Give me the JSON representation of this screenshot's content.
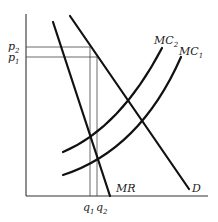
{
  "diagram": {
    "type": "monopoly-cost-shift",
    "axes": {
      "origin": [
        26,
        196
      ],
      "y_top": 20,
      "x_right": 210
    },
    "curves": [
      {
        "name": "MR",
        "label": "MR",
        "path": "M53,22 L110,196"
      },
      {
        "name": "D",
        "label": "D",
        "path": "M70,16 L189,189"
      },
      {
        "name": "MC2",
        "label": "MC",
        "sub": "2",
        "path": "M63,152 Q120,125 162,48"
      },
      {
        "name": "MC1",
        "label": "MC",
        "sub": "1",
        "path": "M63,175 Q140,148 181,57"
      }
    ],
    "price_labels": [
      {
        "label": "p",
        "sub": "2",
        "y": 47
      },
      {
        "label": "p",
        "sub": "1",
        "y": 57
      }
    ],
    "quantity_labels": [
      {
        "label": "q",
        "sub": "1",
        "x": 90
      },
      {
        "label": "q",
        "sub": "2",
        "x": 97
      }
    ],
    "curve_labels": {
      "mc2": {
        "text": "MC",
        "sub": "2"
      },
      "mc1": {
        "text": "MC",
        "sub": "1"
      },
      "mr": {
        "text": "MR"
      },
      "d": {
        "text": "D"
      }
    },
    "axis_labels": {
      "p2": {
        "text": "p",
        "sub": "2"
      },
      "p1": {
        "text": "p",
        "sub": "1"
      },
      "q1": {
        "text": "q",
        "sub": "1"
      },
      "q2": {
        "text": "q",
        "sub": "2"
      }
    }
  }
}
